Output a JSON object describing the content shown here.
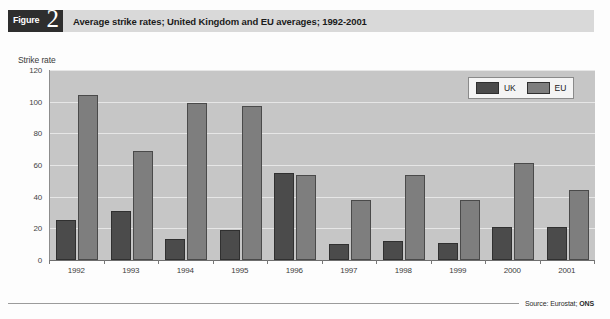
{
  "figure": {
    "badge_word": "Figure",
    "badge_number": "2",
    "title": "Average strike rates; United Kingdom and EU averages; 1992-2001",
    "source_prefix": "Source: Eurostat; ",
    "source_bold": "ONS"
  },
  "legend": {
    "position": "top-right",
    "items": [
      {
        "label": "UK",
        "color": "#4b4b4b"
      },
      {
        "label": "EU",
        "color": "#7e7e7e"
      }
    ]
  },
  "colors": {
    "uk": "#4b4b4b",
    "eu": "#7e7e7e",
    "plot_background": "#c6c6c6",
    "header_band": "#d9d9d9",
    "badge_background": "#2e2e2e",
    "gridline": "#e6e6e6"
  },
  "chart_data": {
    "type": "bar",
    "title": "Average strike rates; United Kingdom and EU averages; 1992-2001",
    "xlabel": "",
    "ylabel": "Strike rate",
    "ylim": [
      0,
      120
    ],
    "yticks": [
      0,
      20,
      40,
      60,
      80,
      100,
      120
    ],
    "ytick_labels": [
      "0",
      "20",
      "40",
      "60",
      "80",
      "100",
      "120"
    ],
    "grid": true,
    "legend_position": "upper right",
    "categories": [
      "1992",
      "1993",
      "1994",
      "1995",
      "1996",
      "1997",
      "1998",
      "1999",
      "2000",
      "2001"
    ],
    "series": [
      {
        "name": "UK",
        "color": "#4b4b4b",
        "values": [
          25,
          31,
          13,
          19,
          55,
          10,
          12,
          11,
          21,
          21
        ]
      },
      {
        "name": "EU",
        "color": "#7e7e7e",
        "values": [
          104,
          69,
          99,
          97,
          54,
          38,
          54,
          38,
          61,
          44
        ]
      }
    ]
  }
}
